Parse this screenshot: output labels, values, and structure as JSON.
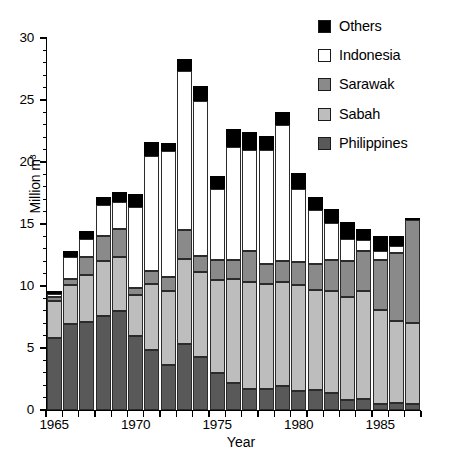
{
  "chart_data": {
    "type": "bar",
    "subtype": "stacked-bar",
    "title": "",
    "xlabel": "Year",
    "ylabel": "Million m³",
    "ylim": [
      0,
      30
    ],
    "ytick_labels": [
      "0",
      "5",
      "10",
      "15",
      "20",
      "25",
      "30"
    ],
    "ytick_values": [
      0,
      5,
      10,
      15,
      20,
      25,
      30
    ],
    "yminor_interval": 1,
    "xlim": [
      1964.5,
      1987.5
    ],
    "xtick_labels": [
      "1965",
      "1970",
      "1975",
      "1980",
      "1985"
    ],
    "xtick_values": [
      1965,
      1970,
      1975,
      1980,
      1985
    ],
    "grid": false,
    "legend_position": "top-right",
    "categories": [
      1965,
      1966,
      1967,
      1968,
      1969,
      1970,
      1971,
      1972,
      1973,
      1974,
      1975,
      1976,
      1977,
      1978,
      1979,
      1980,
      1981,
      1982,
      1983,
      1984,
      1985,
      1986,
      1987
    ],
    "series": [
      {
        "name": "Philippines",
        "color": "#595959",
        "values": [
          5.8,
          6.9,
          7.1,
          7.6,
          8.0,
          6.0,
          4.8,
          3.6,
          5.3,
          4.3,
          3.0,
          2.2,
          1.7,
          1.7,
          1.9,
          1.5,
          1.6,
          1.4,
          0.8,
          0.9,
          0.5,
          0.6,
          0.5
        ]
      },
      {
        "name": "Sabah",
        "color": "#bdbdbd",
        "values": [
          3.0,
          3.2,
          3.8,
          4.4,
          4.3,
          3.3,
          5.4,
          6.0,
          6.9,
          6.8,
          7.5,
          8.4,
          8.6,
          8.5,
          8.4,
          8.6,
          8.1,
          8.2,
          8.3,
          8.7,
          7.6,
          6.6,
          6.5
        ]
      },
      {
        "name": "Sarawak",
        "color": "#8a8a8a",
        "values": [
          0.35,
          0.45,
          1.4,
          2.0,
          2.3,
          0.5,
          1.0,
          1.1,
          2.3,
          1.3,
          1.6,
          1.5,
          2.5,
          1.6,
          1.7,
          1.8,
          2.1,
          2.5,
          2.9,
          3.2,
          4.0,
          5.5,
          8.3
        ]
      },
      {
        "name": "Indonesia",
        "color": "#ffffff",
        "values": [
          0.2,
          1.8,
          1.5,
          2.5,
          2.2,
          6.6,
          9.3,
          10.2,
          12.8,
          12.5,
          5.7,
          9.1,
          8.2,
          9.2,
          11.0,
          5.9,
          4.3,
          3.0,
          1.8,
          0.9,
          0.7,
          0.5,
          0.0
        ]
      },
      {
        "name": "Others",
        "color": "#000000",
        "values": [
          0.25,
          0.45,
          0.6,
          0.7,
          0.8,
          1.0,
          1.1,
          0.6,
          1.0,
          1.2,
          1.1,
          1.5,
          1.4,
          1.1,
          1.0,
          1.3,
          1.1,
          1.1,
          1.4,
          0.9,
          1.2,
          0.8,
          0.2
        ]
      }
    ],
    "totals": [
      9.6,
      12.8,
      14.4,
      17.2,
      17.6,
      17.4,
      21.6,
      21.5,
      28.3,
      26.1,
      18.9,
      22.7,
      22.4,
      22.1,
      24.0,
      19.1,
      17.2,
      16.2,
      15.2,
      14.6,
      14.0,
      14.0,
      15.5
    ]
  },
  "legend": {
    "items": [
      {
        "label": "Others",
        "color": "#000000"
      },
      {
        "label": "Indonesia",
        "color": "#ffffff"
      },
      {
        "label": "Sarawak",
        "color": "#8a8a8a"
      },
      {
        "label": "Sabah",
        "color": "#bdbdbd"
      },
      {
        "label": "Philippines",
        "color": "#595959"
      }
    ]
  },
  "axes": {
    "y_title": "Million m³",
    "x_title": "Year"
  }
}
